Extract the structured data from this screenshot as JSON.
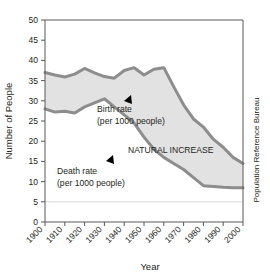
{
  "chart_data": {
    "type": "area",
    "title": "",
    "xlabel": "Year",
    "ylabel": "Number of People",
    "xlim": [
      1900,
      2000
    ],
    "ylim": [
      0,
      50
    ],
    "grid": false,
    "legend_position": "inline-annotations",
    "x_ticks": [
      "1900",
      "1910",
      "1920",
      "1930",
      "1940",
      "1950",
      "1960",
      "1970",
      "1980",
      "1990",
      "2000"
    ],
    "y_ticks": [
      "0",
      "5",
      "10",
      "15",
      "20",
      "25",
      "30",
      "35",
      "40",
      "45",
      "50"
    ],
    "x": [
      1900,
      1905,
      1910,
      1915,
      1920,
      1925,
      1930,
      1935,
      1940,
      1945,
      1950,
      1955,
      1960,
      1965,
      1970,
      1975,
      1980,
      1985,
      1990,
      1995,
      2000
    ],
    "series": [
      {
        "name": "Birth rate",
        "unit": "per 1000 people",
        "color": "#8d8d8d",
        "values": [
          37.0,
          36.4,
          35.9,
          36.6,
          38.0,
          36.9,
          36.0,
          35.6,
          37.5,
          38.2,
          36.4,
          37.8,
          38.2,
          33.5,
          29.0,
          25.5,
          23.5,
          20.5,
          18.5,
          16.0,
          14.5
        ]
      },
      {
        "name": "Death rate",
        "unit": "per 1000 people",
        "color": "#8d8d8d",
        "values": [
          28.0,
          27.2,
          27.4,
          27.0,
          28.5,
          29.5,
          30.5,
          28.5,
          26.5,
          24.5,
          21.0,
          18.0,
          16.0,
          14.5,
          13.0,
          11.0,
          9.0,
          8.8,
          8.6,
          8.5,
          8.5
        ]
      }
    ],
    "annotations": [
      {
        "id": "birth-rate-label",
        "line1": "Birth rate",
        "line2": "(per 1000 people)"
      },
      {
        "id": "death-rate-label",
        "line1": "Death rate",
        "line2": "(per 1000 people)"
      },
      {
        "id": "natural-increase-label",
        "text": "NATURAL INCREASE"
      }
    ],
    "credit": "Population Reference Bureau",
    "band_fill": "#e2e2e2",
    "line_color": "#8d8d8d",
    "axis_color": "#58595b"
  }
}
